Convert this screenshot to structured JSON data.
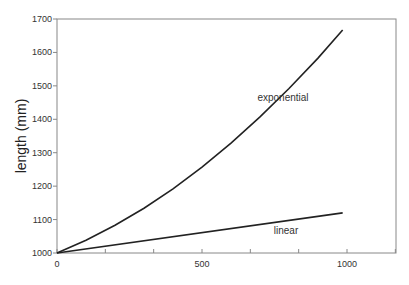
{
  "chart_data": {
    "type": "line",
    "title": "",
    "xlabel": "",
    "ylabel": "length (mm)",
    "xlim": [
      0,
      1170
    ],
    "ylim": [
      1000,
      1700
    ],
    "grid": false,
    "x_ticks": [
      0,
      500,
      1000
    ],
    "x_minor_ticks": [
      0,
      166.7,
      333.3,
      500,
      666.7,
      833.3,
      1000,
      1166.7
    ],
    "y_ticks": [
      1000,
      1100,
      1200,
      1300,
      1400,
      1500,
      1600,
      1700
    ],
    "series": [
      {
        "name": "exponential",
        "x": [
          0,
          100,
          200,
          300,
          400,
          500,
          600,
          700,
          800,
          900,
          985
        ],
        "values": [
          1000,
          1038,
          1083,
          1134,
          1192,
          1257,
          1329,
          1407,
          1492,
          1583,
          1667
        ]
      },
      {
        "name": "linear",
        "x": [
          0,
          985
        ],
        "values": [
          1000,
          1120
        ]
      }
    ],
    "legend": "inline labels"
  }
}
